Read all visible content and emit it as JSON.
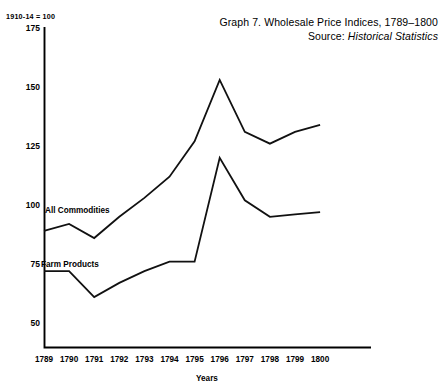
{
  "figure": {
    "unit_note": "1910-14 = 100",
    "title_line1": "Graph 7.  Wholesale Price Indices, 1789–1800",
    "source_prefix": "Source: ",
    "source_name": "Historical Statistics"
  },
  "chart_data": {
    "type": "line",
    "title": "Graph 7.  Wholesale Price Indices, 1789–1800",
    "subtitle": "Source: Historical Statistics",
    "note": "1910-14 = 100",
    "xlabel": "Years",
    "ylabel": "",
    "categories": [
      "1789",
      "1790",
      "1791",
      "1792",
      "1793",
      "1794",
      "1795",
      "1796",
      "1797",
      "1798",
      "1799",
      "1800"
    ],
    "x": [
      1789,
      1790,
      1791,
      1792,
      1793,
      1794,
      1795,
      1796,
      1797,
      1798,
      1799,
      1800
    ],
    "ylim": [
      45,
      175
    ],
    "yticks": [
      50,
      75,
      100,
      125,
      150,
      175
    ],
    "ytick_labels": [
      "50",
      "75",
      "100",
      "125",
      "150",
      "175"
    ],
    "grid": false,
    "legend": "inline-labels",
    "series": [
      {
        "name": "All Commodities",
        "values": [
          89,
          92,
          86,
          95,
          103,
          112,
          127,
          153,
          131,
          126,
          131,
          134
        ]
      },
      {
        "name": "Farm Products",
        "values": [
          72,
          72,
          61,
          67,
          72,
          76,
          76,
          120,
          102,
          95,
          96,
          97
        ]
      }
    ]
  },
  "axis": {
    "x_axis_title": "Years"
  }
}
